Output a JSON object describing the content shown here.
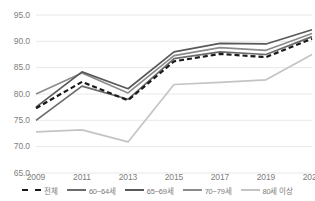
{
  "chart_data": {
    "type": "line",
    "title": "",
    "xlabel": "",
    "ylabel": "",
    "categories": [
      "2009",
      "2011",
      "2013",
      "2015",
      "2017",
      "2019",
      "2021"
    ],
    "x": [
      2009,
      2011,
      2013,
      2015,
      2017,
      2019,
      2021
    ],
    "ylim": [
      65.0,
      95.0
    ],
    "yticks": [
      "95.0",
      "90.0",
      "85.0",
      "80.0",
      "75.0",
      "70.0",
      "65.0"
    ],
    "ytick_values": [
      95.0,
      90.0,
      85.0,
      80.0,
      75.0,
      70.0,
      65.0
    ],
    "grid": true,
    "legend_position": "bottom",
    "series": [
      {
        "name": "전체",
        "values": [
          77.3,
          82.3,
          78.8,
          86.2,
          87.6,
          87.0,
          90.5
        ],
        "color": "#1a1a1a",
        "style": "dashed",
        "width": 2.2
      },
      {
        "name": "60~64세",
        "values": [
          75.0,
          81.5,
          79.0,
          86.7,
          88.0,
          87.5,
          90.9
        ],
        "color": "#6b6b6b",
        "style": "solid",
        "width": 1.7
      },
      {
        "name": "65~69세",
        "values": [
          77.5,
          84.2,
          81.0,
          88.0,
          89.6,
          89.5,
          92.2
        ],
        "color": "#595959",
        "style": "solid",
        "width": 1.7
      },
      {
        "name": "70~79세",
        "values": [
          80.0,
          84.0,
          80.2,
          87.3,
          88.8,
          88.3,
          91.5
        ],
        "color": "#8c8c8c",
        "style": "solid",
        "width": 1.7
      },
      {
        "name": "80세 이상",
        "values": [
          72.8,
          73.2,
          70.9,
          81.8,
          82.2,
          82.7,
          87.5
        ],
        "color": "#c4c4c4",
        "style": "solid",
        "width": 1.7
      }
    ]
  },
  "axis": {
    "gridline_color": "#e8e8e8",
    "tick_label_color": "#808080"
  }
}
